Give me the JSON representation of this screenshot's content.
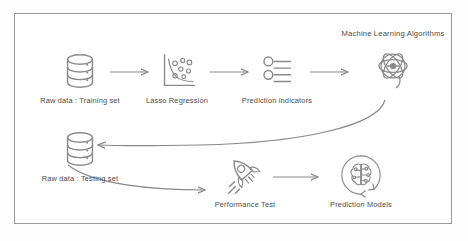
{
  "diagram": {
    "title_node": "Machine Learning Algorithms",
    "frame_color": "#9a9a9a",
    "ink_color": "#8a8a8a",
    "text_color": "#4b4b4b",
    "background": "#ffffff",
    "nodes": [
      {
        "id": "training",
        "label": "Raw data : Training set",
        "icon": "database-icon"
      },
      {
        "id": "lasso",
        "label": "Lasso Regression",
        "icon": "scatter-chart-icon"
      },
      {
        "id": "indicators",
        "label": "Prediction indicators",
        "icon": "sliders-icon"
      },
      {
        "id": "ml",
        "label": "Machine Learning Algorithms",
        "icon": "atom-icon"
      },
      {
        "id": "testing",
        "label": "Raw data : Testing set",
        "icon": "database-icon"
      },
      {
        "id": "performance",
        "label": "Performance Test",
        "icon": "rocket-icon"
      },
      {
        "id": "models",
        "label": "Prediction Models",
        "icon": "brain-circuit-icon"
      }
    ],
    "connectors": [
      {
        "from": "training",
        "to": "lasso",
        "style": "straight-arrow"
      },
      {
        "from": "lasso",
        "to": "indicators",
        "style": "straight-arrow"
      },
      {
        "from": "indicators",
        "to": "ml",
        "style": "straight-arrow"
      },
      {
        "from": "ml",
        "to": "testing",
        "style": "curved-arrow"
      },
      {
        "from": "testing",
        "to": "performance",
        "style": "curved-arrow"
      },
      {
        "from": "performance",
        "to": "models",
        "style": "straight-arrow"
      }
    ]
  }
}
